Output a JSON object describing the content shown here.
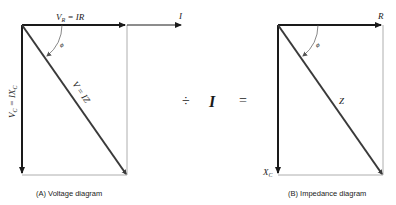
{
  "diagram_a": {
    "caption": "(A) Voltage diagram",
    "vr_label_main": "V",
    "vr_label_sub": "R",
    "vr_label_rest": " = IR",
    "current_label": "I",
    "vc_label_main": "V",
    "vc_label_sub": "C",
    "vc_label_rest": " = IX",
    "vc_label_sub2": "C",
    "v_label": "V = IZ",
    "angle_label": "ϕ"
  },
  "operators": {
    "divide": "÷",
    "current": "I",
    "equals": "="
  },
  "diagram_b": {
    "caption": "(B) Impedance diagram",
    "r_label": "R",
    "xc_label_main": "X",
    "xc_label_sub": "C",
    "z_label": "Z",
    "angle_label": "ϕ"
  },
  "colors": {
    "primary_line": "#1a1a1a",
    "diagonal": "#3a3a3a",
    "thin_line": "#9a9a9a",
    "background": "#ffffff"
  }
}
